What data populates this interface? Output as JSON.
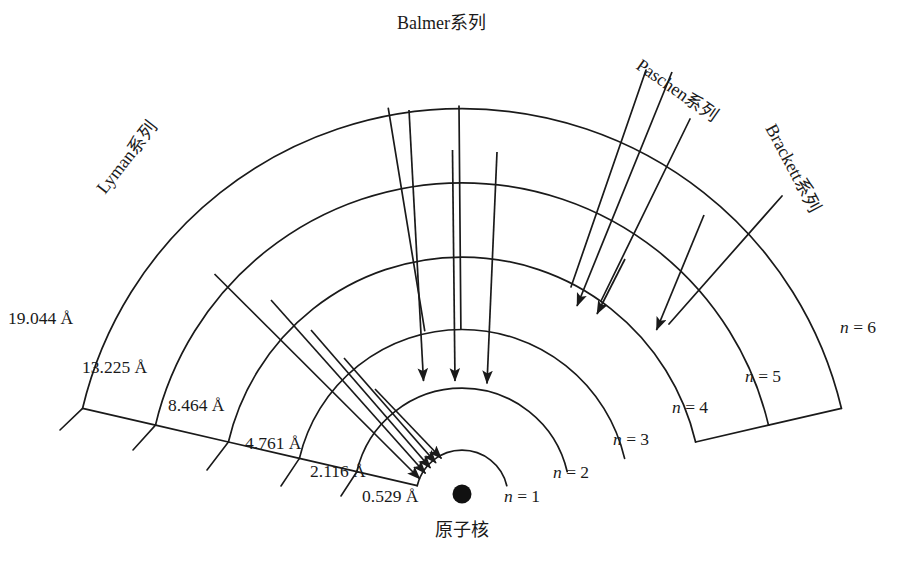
{
  "figure": {
    "nucleus_label": "原子核",
    "nucleus_icon": "filled-circle-nucleus"
  },
  "geometry": {
    "center_x": 462,
    "center_y": 496,
    "nucleus_radius": 9,
    "angle_start_deg": 193,
    "angle_end_deg": 347
  },
  "shells": [
    {
      "n": 1,
      "level_label": "n = 1",
      "radius_text": "0.529 Å",
      "radius_value": 0.529,
      "unit": "Å",
      "px_radius": 46
    },
    {
      "n": 2,
      "level_label": "n = 2",
      "radius_text": "2.116 Å",
      "radius_value": 2.116,
      "unit": "Å",
      "px_radius": 108
    },
    {
      "n": 3,
      "level_label": "n = 3",
      "radius_text": "4.761 Å",
      "radius_value": 4.761,
      "unit": "Å",
      "px_radius": 167
    },
    {
      "n": 4,
      "level_label": "n = 4",
      "radius_text": "8.464 Å",
      "radius_value": 8.464,
      "unit": "Å",
      "px_radius": 240
    },
    {
      "n": 5,
      "level_label": "n = 5",
      "radius_text": "13.225 Å",
      "radius_value": 13.225,
      "unit": "Å",
      "px_radius": 315
    },
    {
      "n": 6,
      "level_label": "n = 6",
      "radius_text": "19.044 Å",
      "radius_value": 19.044,
      "unit": "Å",
      "px_radius": 390
    }
  ],
  "series": [
    {
      "key": "lyman",
      "label": "Lyman系列",
      "lands_on_n": 1
    },
    {
      "key": "balmer",
      "label": "Balmer系列",
      "lands_on_n": 2
    },
    {
      "key": "paschen",
      "label": "Paschen系列",
      "lands_on_n": 3
    },
    {
      "key": "brackett",
      "label": "Brackett系列",
      "lands_on_n": 4
    }
  ],
  "chart_data": {
    "type": "diagram",
    "categories": [
      "n = 1",
      "n = 2",
      "n = 3",
      "n = 4",
      "n = 5",
      "n = 6"
    ],
    "values": [
      0.529,
      2.116,
      4.761,
      8.464,
      13.225,
      19.044
    ],
    "ylabel": "Orbit radius (Å)",
    "xlabel": "Principal quantum number n",
    "annotations": [
      "Lyman系列",
      "Balmer系列",
      "Paschen系列",
      "Brackett系列",
      "原子核"
    ],
    "legend_position": "none",
    "grid": false
  }
}
